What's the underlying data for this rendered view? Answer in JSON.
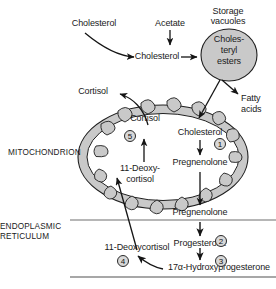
{
  "diagram": {
    "colors": {
      "organelle_fill": "#c9c9c9",
      "organelle_stroke": "#1f1f1f",
      "mito_matrix": "#ffffff",
      "membrane_line": "#8a8a8a",
      "arrow": "#151515",
      "badge_fill": "#d8d8d8",
      "text": "#1a1a1a"
    }
  },
  "compartments": {
    "mitochondrion_label": "MITOCHONDRION",
    "endoplasmic_reticulum_label_line1": "ENDOPLASMIC",
    "endoplasmic_reticulum_label_line2": "RETICULUM"
  },
  "cytosol": {
    "cholesterol_external": "Cholesterol",
    "acetate": "Acetate",
    "cholesterol_pool": "Cholesterol",
    "storage_vacuoles_line1": "Storage",
    "storage_vacuoles_line2": "vacuoles",
    "cholesteryl_esters_line1": "Choles-",
    "cholesteryl_esters_line2": "teryl",
    "cholesteryl_esters_line3": "esters",
    "fatty_acids_line1": "Fatty",
    "fatty_acids_line2": "acids",
    "cortisol_output": "Cortisol"
  },
  "mitochondrion": {
    "cholesterol": "Cholesterol",
    "pregnenolone": "Pregnenolone",
    "cortisol": "Cortisol",
    "deoxycortisol_line1": "11-Deoxy-",
    "deoxycortisol_line2": "cortisol"
  },
  "reticulum": {
    "pregnenolone": "Pregnenolone",
    "progesterone": "Progesterone",
    "hydroxyprogesterone": "17α-Hydroxyprogesterone",
    "deoxycortisol": "11-Deoxycortisol"
  },
  "enzyme_steps": [
    {
      "id": "1",
      "label": "1"
    },
    {
      "id": "2",
      "label": "2"
    },
    {
      "id": "3",
      "label": "3"
    },
    {
      "id": "4",
      "label": "4"
    },
    {
      "id": "5",
      "label": "5"
    }
  ]
}
